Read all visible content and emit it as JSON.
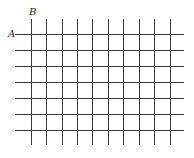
{
  "diagram": {
    "title": "",
    "labels": {
      "a": "A",
      "b": "B"
    },
    "grid": {
      "line_color": "#3a3a3a",
      "line_width": 1,
      "vertical_lines_x": [
        31,
        46,
        62,
        77,
        92,
        108,
        123,
        139,
        154,
        170
      ],
      "vertical_y_start": 19,
      "vertical_y_end": 145,
      "horizontal_lines_y": [
        34,
        50,
        66,
        82,
        98,
        114,
        130
      ],
      "horizontal_x_start": 15,
      "horizontal_x_end": 184
    }
  }
}
